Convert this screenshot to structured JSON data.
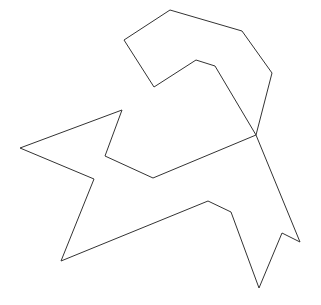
{
  "canvas": {
    "width": 321,
    "height": 305,
    "background": "#ffffff"
  },
  "stroke": {
    "color": "#333333",
    "width": 1
  },
  "shapes": [
    {
      "name": "outer-polygon-outline",
      "points": [
        [
          256,
          135
        ],
        [
          272,
          73
        ],
        [
          242,
          31
        ],
        [
          170,
          10
        ],
        [
          124,
          40
        ],
        [
          154,
          87
        ],
        [
          196,
          60
        ],
        [
          215,
          66
        ],
        [
          256,
          135
        ],
        [
          300,
          242
        ],
        [
          282,
          233
        ],
        [
          259,
          288
        ],
        [
          231,
          212
        ],
        [
          208,
          201
        ],
        [
          61,
          261
        ],
        [
          94,
          179
        ],
        [
          20,
          148
        ],
        [
          122,
          110
        ],
        [
          105,
          156
        ],
        [
          153,
          178
        ],
        [
          256,
          135
        ]
      ]
    }
  ]
}
